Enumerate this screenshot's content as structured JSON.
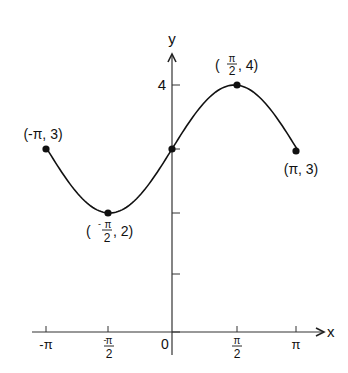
{
  "chart_data": {
    "type": "line",
    "title": "",
    "function": "y = 3 + sin(x)",
    "xlabel": "x",
    "ylabel": "y",
    "xlim": [
      -3.14159,
      3.14159
    ],
    "ylim": [
      0,
      4.6
    ],
    "grid": false,
    "legend": null,
    "x_ticks": [
      {
        "value": -3.14159,
        "label": "-π"
      },
      {
        "value": -1.5708,
        "label": "-π/2"
      },
      {
        "value": 0,
        "label": "0"
      },
      {
        "value": 1.5708,
        "label": "π/2"
      },
      {
        "value": 3.14159,
        "label": "π"
      }
    ],
    "y_ticks": [
      {
        "value": 1,
        "label": ""
      },
      {
        "value": 2,
        "label": ""
      },
      {
        "value": 3,
        "label": ""
      },
      {
        "value": 4,
        "label": "4"
      }
    ],
    "series": [
      {
        "name": "y = 3 + sin x",
        "x": [
          -3.14159,
          -1.5708,
          0,
          1.5708,
          3.14159
        ],
        "values": [
          3,
          2,
          3,
          4,
          3
        ]
      }
    ],
    "annotations": [
      {
        "x": -3.14159,
        "y": 3,
        "text": "(-π, 3)"
      },
      {
        "x": -1.5708,
        "y": 2,
        "text": "(-π/2, 2)"
      },
      {
        "x": 0,
        "y": 3,
        "text": ""
      },
      {
        "x": 1.5708,
        "y": 4,
        "text": "(π/2, 4)"
      },
      {
        "x": 3.14159,
        "y": 3,
        "text": "(π, 3)"
      }
    ]
  },
  "labels": {
    "x_axis": "x",
    "y_axis": "y",
    "y_tick_4": "4",
    "origin": "0",
    "pt_neg_pi": "(-π, 3)",
    "pt_pi": "(π, 3)",
    "pi": "π",
    "neg_pi": "-π",
    "neg": "-",
    "two": "2",
    "comma_2": ", 2)",
    "comma_4": ", 4)",
    "open_paren": "("
  }
}
